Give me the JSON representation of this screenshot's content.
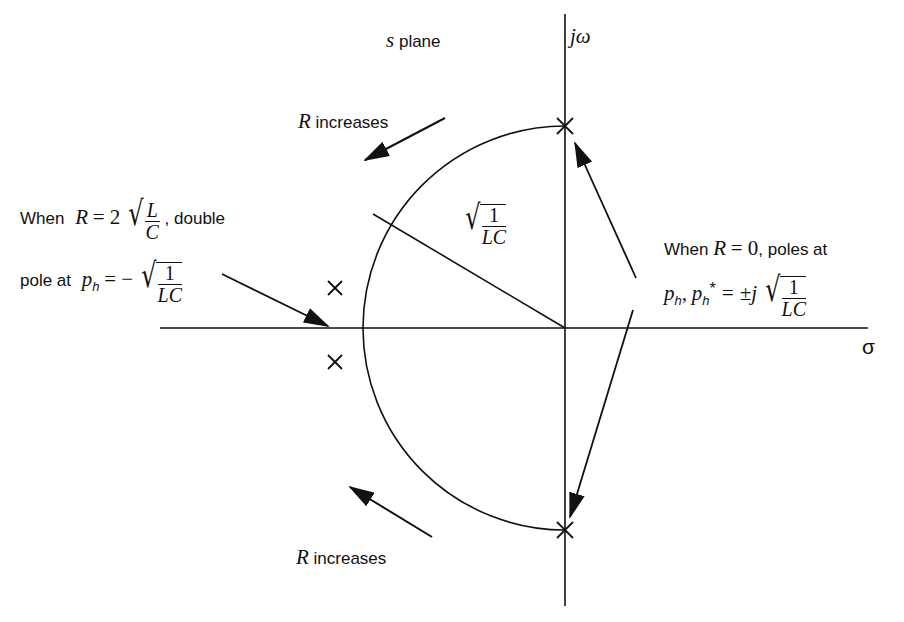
{
  "diagram": {
    "type": "pole-zero locus (s-plane root locus of series RLC)",
    "axes": {
      "imag_label": "jω",
      "real_label": "σ",
      "plane_label_var": "s",
      "plane_label_text": "plane"
    },
    "labels": {
      "r_increases_top": {
        "var": "R",
        "text": "increases"
      },
      "r_increases_bottom": {
        "var": "R",
        "text": "increases"
      },
      "radius": {
        "num": "1",
        "den": "LC"
      },
      "double_pole": {
        "line1_prefix": "When",
        "line1_var": "R",
        "line1_eq": "= 2",
        "line1_frac_num": "L",
        "line1_frac_den": "C",
        "line1_suffix": ", double",
        "line2_prefix": "pole at",
        "line2_var": "p",
        "line2_sub": "h",
        "line2_eq": "= −",
        "line2_frac_num": "1",
        "line2_frac_den": "LC"
      },
      "zero_r": {
        "line1_prefix": "When",
        "line1_var": "R",
        "line1_eq": "= 0",
        "line1_suffix": ", poles at",
        "line2_var1": "p",
        "line2_sub1": "h",
        "line2_comma": ",",
        "line2_var2": "p",
        "line2_sub2": "h",
        "line2_sup2": "*",
        "line2_eq": "= ±j",
        "line2_frac_num": "1",
        "line2_frac_den": "LC"
      }
    },
    "poles": [
      {
        "name": "R=0 upper",
        "x": 565,
        "y": 126
      },
      {
        "name": "R=0 lower",
        "x": 565,
        "y": 530
      },
      {
        "name": "underdamped upper",
        "x": 335,
        "y": 288
      },
      {
        "name": "underdamped lower",
        "x": 335,
        "y": 362
      }
    ],
    "colors": {
      "ink": "#111111",
      "background": "#ffffff"
    }
  }
}
